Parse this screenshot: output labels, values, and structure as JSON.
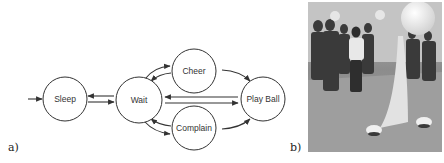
{
  "figure": {
    "panel_a_label": "a)",
    "panel_b_label": "b)",
    "state_machine": {
      "initial_state": "Sleep",
      "nodes": [
        {
          "id": "sleep",
          "label": "Sleep"
        },
        {
          "id": "wait",
          "label": "Wait"
        },
        {
          "id": "cheer",
          "label": "Cheer"
        },
        {
          "id": "complain",
          "label": "Complain"
        },
        {
          "id": "playball",
          "label": "Play Ball"
        }
      ],
      "edges": [
        {
          "from": "start",
          "to": "sleep"
        },
        {
          "from": "sleep",
          "to": "wait"
        },
        {
          "from": "wait",
          "to": "sleep"
        },
        {
          "from": "wait",
          "to": "cheer"
        },
        {
          "from": "cheer",
          "to": "wait"
        },
        {
          "from": "wait",
          "to": "complain"
        },
        {
          "from": "complain",
          "to": "wait"
        },
        {
          "from": "cheer",
          "to": "playball"
        },
        {
          "from": "complain",
          "to": "playball"
        },
        {
          "from": "wait",
          "to": "playball"
        },
        {
          "from": "playball",
          "to": "wait"
        }
      ]
    },
    "photo": {
      "description": "grayscale photo of people watching a large ball mounted on a fabric-covered stand with small dome robots on the floor"
    }
  }
}
